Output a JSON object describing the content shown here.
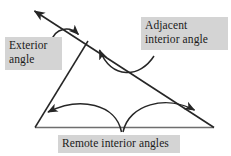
{
  "figure": {
    "type": "geometry-diagram",
    "background_color": "#ffffff",
    "line_color": "#262626",
    "label_background_color": "#d4d4d4",
    "label_text_color": "#1a1a1a"
  },
  "labels": {
    "exterior": "Exterior\nangle",
    "adjacent": "Adjacent\ninterior angle",
    "remote": "Remote interior angles"
  },
  "geometry": {
    "triangle": {
      "apex": [
        88,
        41
      ],
      "bottom_left": [
        35,
        127
      ],
      "bottom_right": [
        214,
        127
      ]
    },
    "transversal": {
      "from": [
        33,
        10
      ],
      "through": [
        88,
        41
      ],
      "to": [
        214,
        127
      ],
      "arrowhead_at": "from"
    },
    "arcs": [
      {
        "name": "exterior-angle-arc",
        "start": [
          52,
          41
        ],
        "end": [
          79,
          36
        ],
        "arrowhead_at": "end"
      },
      {
        "name": "adjacent-interior-angle-arc",
        "start": [
          152,
          56
        ],
        "end": [
          98,
          48
        ],
        "arrowhead_at": "end"
      },
      {
        "name": "remote-angle-arc-left",
        "start": [
          122,
          131
        ],
        "end": [
          46,
          113
        ],
        "arrowhead_at": "end"
      },
      {
        "name": "remote-angle-arc-right",
        "start": [
          122,
          131
        ],
        "end": [
          196,
          111
        ],
        "arrowhead_at": "end"
      }
    ]
  }
}
